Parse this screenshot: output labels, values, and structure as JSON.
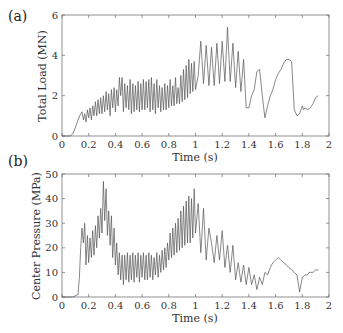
{
  "chart_data": [
    {
      "type": "line",
      "panel_label": "(a)",
      "title": "",
      "xlabel": "Time (s)",
      "ylabel": "Total Load (MN)",
      "xlim": [
        0,
        2
      ],
      "ylim": [
        0,
        6
      ],
      "xticks": [
        0,
        0.2,
        0.4,
        0.6,
        0.8,
        1,
        1.2,
        1.4,
        1.6,
        1.8,
        2
      ],
      "xtick_labels": [
        "0",
        "0.2",
        "0.4",
        "0.6",
        "0.8",
        "1",
        "1.2",
        "1.4",
        "1.6",
        "1.8",
        "2"
      ],
      "yticks": [
        0,
        2,
        4,
        6
      ],
      "ytick_labels": [
        "0",
        "2",
        "4",
        "6"
      ],
      "grid": false,
      "legend": null,
      "series": [
        {
          "name": "Total Load",
          "x": [
            0,
            0.06,
            0.08,
            0.1,
            0.12,
            0.14,
            0.15,
            0.16,
            0.17,
            0.18,
            0.19,
            0.2,
            0.21,
            0.22,
            0.23,
            0.24,
            0.25,
            0.26,
            0.27,
            0.28,
            0.29,
            0.3,
            0.31,
            0.32,
            0.33,
            0.34,
            0.35,
            0.36,
            0.37,
            0.38,
            0.39,
            0.4,
            0.41,
            0.42,
            0.43,
            0.44,
            0.45,
            0.46,
            0.47,
            0.48,
            0.49,
            0.5,
            0.51,
            0.52,
            0.53,
            0.54,
            0.55,
            0.56,
            0.57,
            0.58,
            0.59,
            0.6,
            0.61,
            0.62,
            0.63,
            0.64,
            0.65,
            0.66,
            0.67,
            0.68,
            0.69,
            0.7,
            0.71,
            0.72,
            0.73,
            0.74,
            0.75,
            0.76,
            0.77,
            0.78,
            0.79,
            0.8,
            0.81,
            0.82,
            0.83,
            0.84,
            0.85,
            0.86,
            0.87,
            0.88,
            0.89,
            0.9,
            0.91,
            0.92,
            0.93,
            0.94,
            0.95,
            0.96,
            0.97,
            0.98,
            0.99,
            1.0,
            1.02,
            1.04,
            1.06,
            1.08,
            1.1,
            1.12,
            1.14,
            1.16,
            1.18,
            1.2,
            1.22,
            1.24,
            1.26,
            1.28,
            1.3,
            1.32,
            1.34,
            1.36,
            1.38,
            1.4,
            1.42,
            1.44,
            1.46,
            1.48,
            1.5,
            1.52,
            1.54,
            1.56,
            1.58,
            1.6,
            1.62,
            1.64,
            1.66,
            1.68,
            1.7,
            1.72,
            1.74,
            1.76,
            1.78,
            1.8,
            1.81,
            1.82,
            1.84,
            1.86,
            1.88,
            1.9,
            1.92,
            1.94,
            1.96,
            1.98,
            2.0
          ],
          "values": [
            0,
            0,
            0.1,
            0.4,
            0.8,
            1.1,
            1.2,
            0.8,
            1.1,
            0.7,
            1.3,
            0.9,
            1.4,
            0.8,
            1.5,
            1.0,
            1.7,
            1.0,
            1.8,
            1.1,
            1.9,
            1.1,
            2.0,
            1.2,
            2.2,
            1.3,
            2.1,
            1.0,
            2.3,
            1.4,
            2.4,
            1.2,
            2.3,
            1.5,
            2.9,
            2.0,
            2.9,
            1.2,
            2.6,
            1.4,
            2.5,
            1.3,
            2.8,
            1.1,
            2.6,
            1.2,
            2.5,
            1.3,
            2.7,
            1.2,
            2.6,
            1.3,
            2.8,
            1.3,
            2.7,
            1.4,
            2.8,
            1.2,
            2.9,
            1.3,
            2.6,
            1.1,
            2.8,
            1.4,
            2.5,
            1.2,
            2.4,
            1.3,
            2.6,
            1.3,
            2.5,
            1.4,
            2.8,
            1.5,
            2.5,
            1.5,
            2.9,
            1.6,
            2.4,
            1.6,
            3.0,
            1.7,
            3.3,
            1.8,
            3.5,
            1.9,
            3.8,
            2.1,
            3.6,
            2.2,
            3.7,
            2.3,
            3.0,
            4.7,
            2.6,
            4.5,
            2.5,
            4.4,
            2.5,
            4.6,
            2.6,
            4.7,
            2.7,
            5.4,
            2.7,
            4.6,
            2.4,
            4.2,
            2.2,
            3.8,
            1.4,
            1.4,
            2.0,
            2.3,
            3.2,
            3.3,
            2.0,
            0.9,
            1.5,
            2.0,
            2.3,
            2.8,
            3.1,
            3.3,
            3.6,
            3.8,
            3.8,
            3.7,
            1.3,
            1.0,
            1.1,
            1.5,
            1.3,
            1.4,
            1.3,
            1.4,
            1.6,
            1.9,
            2.0
          ]
        }
      ]
    },
    {
      "type": "line",
      "panel_label": "(b)",
      "title": "",
      "xlabel": "Time (s)",
      "ylabel": "Center Pressure (MPa)",
      "xlim": [
        0,
        2
      ],
      "ylim": [
        0,
        50
      ],
      "xticks": [
        0,
        0.2,
        0.4,
        0.6,
        0.8,
        1,
        1.2,
        1.4,
        1.6,
        1.8,
        2
      ],
      "xtick_labels": [
        "0",
        "0.2",
        "0.4",
        "0.6",
        "0.8",
        "1",
        "1.2",
        "1.4",
        "1.6",
        "1.8",
        "2"
      ],
      "yticks": [
        0,
        10,
        20,
        30,
        40,
        50
      ],
      "ytick_labels": [
        "0",
        "10",
        "20",
        "30",
        "40",
        "50"
      ],
      "grid": false,
      "legend": null,
      "series": [
        {
          "name": "Center Pressure",
          "x": [
            0,
            0.08,
            0.1,
            0.12,
            0.13,
            0.14,
            0.15,
            0.16,
            0.17,
            0.18,
            0.19,
            0.2,
            0.21,
            0.22,
            0.23,
            0.24,
            0.25,
            0.26,
            0.27,
            0.28,
            0.29,
            0.3,
            0.31,
            0.32,
            0.33,
            0.34,
            0.35,
            0.36,
            0.37,
            0.38,
            0.39,
            0.4,
            0.41,
            0.42,
            0.43,
            0.44,
            0.45,
            0.46,
            0.47,
            0.48,
            0.49,
            0.5,
            0.51,
            0.52,
            0.53,
            0.54,
            0.55,
            0.56,
            0.57,
            0.58,
            0.59,
            0.6,
            0.61,
            0.62,
            0.63,
            0.64,
            0.65,
            0.66,
            0.67,
            0.68,
            0.69,
            0.7,
            0.71,
            0.72,
            0.73,
            0.74,
            0.75,
            0.76,
            0.77,
            0.78,
            0.79,
            0.8,
            0.81,
            0.82,
            0.83,
            0.84,
            0.85,
            0.86,
            0.87,
            0.88,
            0.89,
            0.9,
            0.91,
            0.92,
            0.93,
            0.94,
            0.95,
            0.96,
            0.97,
            0.98,
            0.99,
            1.0,
            1.02,
            1.04,
            1.06,
            1.08,
            1.1,
            1.12,
            1.14,
            1.16,
            1.18,
            1.2,
            1.22,
            1.24,
            1.26,
            1.28,
            1.3,
            1.32,
            1.34,
            1.36,
            1.38,
            1.4,
            1.42,
            1.44,
            1.46,
            1.48,
            1.5,
            1.52,
            1.54,
            1.56,
            1.58,
            1.6,
            1.62,
            1.64,
            1.66,
            1.68,
            1.7,
            1.72,
            1.74,
            1.76,
            1.78,
            1.8,
            1.82,
            1.84,
            1.85,
            1.86,
            1.88,
            1.9,
            1.92,
            1.94,
            1.96,
            1.98,
            2.0
          ],
          "values": [
            0,
            0,
            0.5,
            1,
            8,
            20,
            28,
            22,
            30,
            13,
            25,
            14,
            24,
            16,
            27,
            17,
            29,
            20,
            33,
            24,
            36,
            26,
            47,
            31,
            44,
            25,
            35,
            21,
            33,
            16,
            28,
            13,
            22,
            9,
            18,
            7,
            17,
            5,
            17,
            7,
            18,
            6,
            17,
            7,
            18,
            6,
            17,
            8,
            18,
            6,
            17,
            8,
            18,
            7,
            17,
            7,
            18,
            8,
            17,
            7,
            16,
            9,
            18,
            8,
            17,
            10,
            19,
            11,
            20,
            12,
            22,
            15,
            26,
            16,
            28,
            17,
            30,
            18,
            32,
            19,
            35,
            20,
            37,
            21,
            39,
            22,
            41,
            22,
            40,
            24,
            44,
            26,
            38,
            18,
            36,
            15,
            28,
            22,
            14,
            25,
            15,
            27,
            12,
            21,
            10,
            21,
            7,
            14,
            6,
            13,
            5,
            12,
            5,
            9,
            3,
            8,
            5,
            10,
            9,
            12,
            14,
            15,
            16,
            15,
            14,
            13,
            12,
            11,
            10,
            9,
            2,
            8,
            9,
            9,
            10,
            10,
            10,
            11,
            11
          ]
        }
      ]
    }
  ]
}
